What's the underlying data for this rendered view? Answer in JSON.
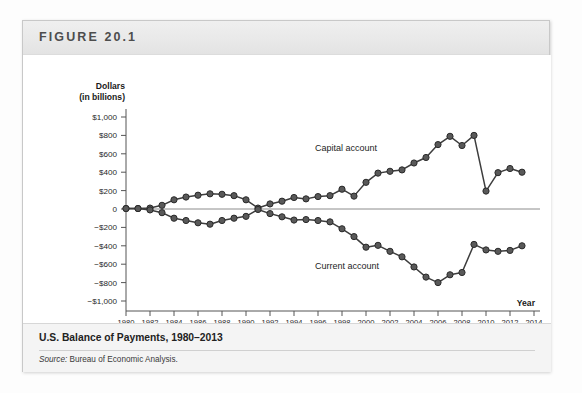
{
  "figure": {
    "number_label": "FIGURE 20.1",
    "caption": "U.S. Balance of Payments, 1980–2013",
    "source_prefix": "Source:",
    "source_text": " Bureau of Economic Analysis."
  },
  "axis": {
    "y_title_line1": "Dollars",
    "y_title_line2": "(in billions)",
    "x_title": "Year"
  },
  "colors": {
    "line": "#3d3d3d",
    "marker_fill": "#595959",
    "marker_stroke": "#2b2b2b",
    "axis": "#555555",
    "zero_line": "#8c8c8c",
    "header_band": "#e9e9e9",
    "caption_band": "#f4f4f4"
  },
  "chart_data": {
    "type": "line",
    "title": "U.S. Balance of Payments, 1980–2013",
    "xlabel": "Year",
    "ylabel": "Dollars (in billions)",
    "xlim": [
      1980,
      2014
    ],
    "ylim": [
      -1000,
      1000
    ],
    "ytick_labels": [
      "$1,000",
      "$800",
      "$600",
      "$400",
      "$200",
      "0",
      "−$200",
      "−$400",
      "−$600",
      "−$800",
      "−$1,000"
    ],
    "ytick_values": [
      1000,
      800,
      600,
      400,
      200,
      0,
      -200,
      -400,
      -600,
      -800,
      -1000
    ],
    "xtick_labels": [
      "1980",
      "1982",
      "1984",
      "1986",
      "1988",
      "1990",
      "1992",
      "1994",
      "1996",
      "1998",
      "2000",
      "2002",
      "2004",
      "2006",
      "2008",
      "2010",
      "2012",
      "2014"
    ],
    "xtick_values": [
      1980,
      1982,
      1984,
      1986,
      1988,
      1990,
      1992,
      1994,
      1996,
      1998,
      2000,
      2002,
      2004,
      2006,
      2008,
      2010,
      2012,
      2014
    ],
    "grid": false,
    "legend": "inline-labels",
    "x": [
      1980,
      1981,
      1982,
      1983,
      1984,
      1985,
      1986,
      1987,
      1988,
      1989,
      1990,
      1991,
      1992,
      1993,
      1994,
      1995,
      1996,
      1997,
      1998,
      1999,
      2000,
      2001,
      2002,
      2003,
      2004,
      2005,
      2006,
      2007,
      2008,
      2009,
      2010,
      2011,
      2012,
      2013
    ],
    "series": [
      {
        "name": "Capital account",
        "label_x": 2000,
        "values": [
          5,
          5,
          10,
          40,
          100,
          130,
          150,
          165,
          160,
          145,
          100,
          10,
          55,
          85,
          125,
          110,
          135,
          145,
          215,
          140,
          290,
          390,
          410,
          425,
          500,
          560,
          700,
          790,
          690,
          800,
          195,
          395,
          440,
          400
        ]
      },
      {
        "name": "Current account",
        "label_x": 2000,
        "values": [
          5,
          5,
          -10,
          -40,
          -100,
          -125,
          -150,
          -165,
          -125,
          -100,
          -80,
          -5,
          -50,
          -85,
          -120,
          -115,
          -125,
          -140,
          -215,
          -300,
          -415,
          -395,
          -460,
          -520,
          -630,
          -740,
          -800,
          -715,
          -690,
          -385,
          -445,
          -460,
          -450,
          -400
        ]
      }
    ]
  }
}
